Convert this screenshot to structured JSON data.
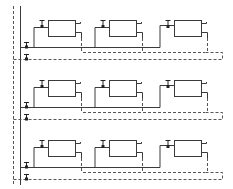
{
  "diagram": {
    "type": "schematic",
    "colors": {
      "line": "#3a3a3a",
      "dash": "#555555",
      "background": "#ffffff"
    },
    "rows": [
      {
        "offset_y": 0,
        "blocks": 3
      },
      {
        "offset_y": 60,
        "blocks": 3
      },
      {
        "offset_y": 120,
        "blocks": 3
      }
    ],
    "block_x": [
      48,
      109,
      174
    ],
    "labels": []
  }
}
